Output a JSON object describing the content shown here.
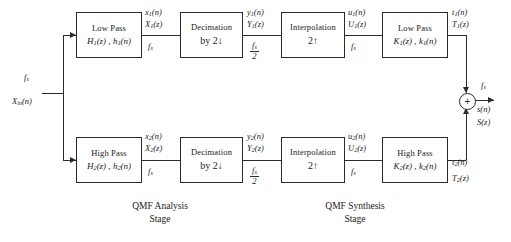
{
  "diagram": {
    "type": "signal-flow-block-diagram",
    "line_color": "#2b2b2b",
    "background": "#ffffff"
  },
  "input": {
    "rate_label": "f",
    "rate_sub": "s",
    "signal_name": "X",
    "signal_sub": "in",
    "signal_arg": "(n)"
  },
  "blocks": {
    "analysis_lowpass": {
      "line1": "Low Pass",
      "line2_a": "H",
      "line2_a_sub": "1",
      "line2_a_arg": "(z) ,",
      "line2_b": "h",
      "line2_b_sub": "1",
      "line2_b_arg": "(n)"
    },
    "analysis_highpass": {
      "line1": "High Pass",
      "line2_a": "H",
      "line2_a_sub": "2",
      "line2_a_arg": "(z) ,",
      "line2_b": "h",
      "line2_b_sub": "2",
      "line2_b_arg": "(n)"
    },
    "decimator_top": {
      "line1": "Decimation",
      "line2": "by 2",
      "arrow": "↓"
    },
    "decimator_bottom": {
      "line1": "Decimation",
      "line2": "by 2",
      "arrow": "↓"
    },
    "interpolator_top": {
      "line1": "Interpolation",
      "line2": "2",
      "arrow": "↑"
    },
    "interpolator_bottom": {
      "line1": "Interpolation",
      "line2": "2",
      "arrow": "↑"
    },
    "synthesis_lowpass": {
      "line1": "Low Pass",
      "line2_a": "K",
      "line2_a_sub": "1",
      "line2_a_arg": "(z) ,",
      "line2_b": "k",
      "line2_b_sub": "1",
      "line2_b_arg": "(n)"
    },
    "synthesis_highpass": {
      "line1": "High Pass",
      "line2_a": "K",
      "line2_a_sub": "2",
      "line2_a_arg": "(z) ,",
      "line2_b": "k",
      "line2_b_sub": "2",
      "line2_b_arg": "(n)"
    }
  },
  "signals": {
    "x1_time": "x",
    "x1_sub": "1",
    "x1_arg": "(n)",
    "x1_z": "X",
    "x1_z_sub": "1",
    "x1_z_arg": "(z)",
    "x2_time": "x",
    "x2_sub": "2",
    "x2_arg": "(n)",
    "x2_z": "X",
    "x2_z_sub": "2",
    "x2_z_arg": "(z)",
    "y1_time": "y",
    "y1_sub": "1",
    "y1_arg": "(n)",
    "y1_z": "Y",
    "y1_z_sub": "1",
    "y1_z_arg": "(z)",
    "y2_time": "y",
    "y2_sub": "2",
    "y2_arg": "(n)",
    "y2_z": "Y",
    "y2_z_sub": "2",
    "y2_z_arg": "(z)",
    "u1_time": "u",
    "u1_sub": "1",
    "u1_arg": "(n)",
    "u1_z": "U",
    "u1_z_sub": "1",
    "u1_z_arg": "(z)",
    "u2_time": "u",
    "u2_sub": "2",
    "u2_arg": "(n)",
    "u2_z": "U",
    "u2_z_sub": "2",
    "u2_z_arg": "(z)",
    "t1_time": "t",
    "t1_sub": "1",
    "t1_arg": "(n)",
    "t1_z": "T",
    "t1_z_sub": "1",
    "t1_z_arg": "(z)",
    "t2_time": "t",
    "t2_sub": "2",
    "t2_arg": "(n)",
    "t2_z": "T",
    "t2_z_sub": "2",
    "t2_z_arg": "(z)",
    "s_time": "s",
    "s_arg": "(n)",
    "s_z": "S",
    "s_z_arg": "(z)"
  },
  "rates": {
    "fs": "f",
    "fs_sub": "s",
    "fs_half_num": "f",
    "fs_half_num_sub": "s",
    "fs_half_den": "2"
  },
  "adder": {
    "symbol": "+",
    "name": "summing-junction"
  },
  "captions": {
    "analysis_line1": "QMF Analysis",
    "analysis_line2": "Stage",
    "synthesis_line1": "QMF Synthesis",
    "synthesis_line2": "Stage"
  }
}
